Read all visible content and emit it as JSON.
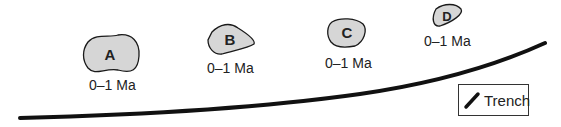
{
  "diagram": {
    "volcanoes": [
      {
        "id": "A",
        "age_label": "0–1 Ma"
      },
      {
        "id": "B",
        "age_label": "0–1 Ma"
      },
      {
        "id": "C",
        "age_label": "0–1 Ma"
      },
      {
        "id": "D",
        "age_label": "0–1 Ma"
      }
    ],
    "legend": {
      "label": "Trench",
      "icon": "trench-line-icon"
    },
    "colors": {
      "volcano_fill": "#d6d6d6",
      "outline": "#1a1a1a",
      "trench": "#111111"
    }
  }
}
